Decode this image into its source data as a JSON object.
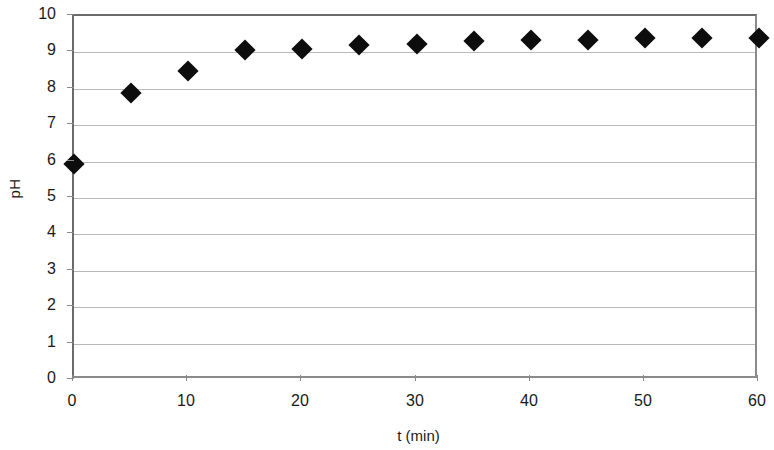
{
  "chart_data": {
    "type": "scatter",
    "title": "",
    "xlabel": "t (min)",
    "ylabel": "pH",
    "xlim": [
      0,
      60
    ],
    "ylim": [
      0,
      10
    ],
    "xticks": [
      0,
      10,
      20,
      30,
      40,
      50,
      60
    ],
    "yticks": [
      0,
      1,
      2,
      3,
      4,
      5,
      6,
      7,
      8,
      9,
      10
    ],
    "grid": "horizontal",
    "legend": "none",
    "marker": "diamond",
    "marker_color": "#0d0d0d",
    "grid_color": "#b9b9b9",
    "axis_color": "#6b6b6b",
    "x": [
      0,
      5,
      10,
      15,
      20,
      25,
      30,
      35,
      40,
      45,
      50,
      55,
      60
    ],
    "values": [
      5.93,
      7.89,
      8.5,
      9.07,
      9.1,
      9.2,
      9.23,
      9.3,
      9.35,
      9.34,
      9.4,
      9.4,
      9.4
    ],
    "series": [
      {
        "name": "pH",
        "values": [
          5.93,
          7.89,
          8.5,
          9.07,
          9.1,
          9.2,
          9.23,
          9.3,
          9.35,
          9.34,
          9.4,
          9.4,
          9.4
        ]
      }
    ]
  },
  "axes": {
    "y_title": "pH",
    "x_title": "t (min)",
    "y_tick_labels": [
      "0",
      "1",
      "2",
      "3",
      "4",
      "5",
      "6",
      "7",
      "8",
      "9",
      "10"
    ],
    "x_tick_labels": [
      "0",
      "10",
      "20",
      "30",
      "40",
      "50",
      "60"
    ]
  }
}
